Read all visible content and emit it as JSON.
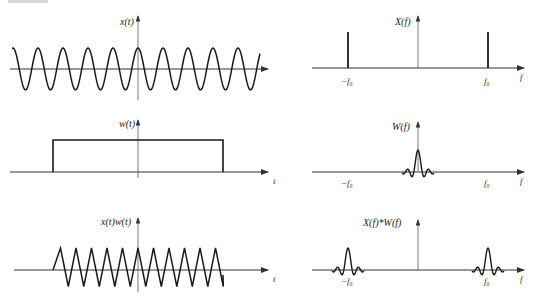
{
  "header_fragment": "",
  "panels": {
    "time": [
      {
        "id": "x",
        "ylabel": "x(t)",
        "xlabel": "",
        "signal": "cosine",
        "cycles": 10
      },
      {
        "id": "w",
        "ylabel": "w(t)",
        "xlabel": "t",
        "signal": "rectangular-window"
      },
      {
        "id": "xw",
        "ylabel": "x(t)w(t)",
        "xlabel": "t",
        "signal": "truncated-cosine",
        "cycles": 11
      }
    ],
    "freq": [
      {
        "id": "X",
        "ylabel": "X(f)",
        "xlabel": "f",
        "ticks": [
          "−f₀",
          "f₀"
        ],
        "signal": "impulses at ±f0"
      },
      {
        "id": "W",
        "ylabel": "W(f)",
        "xlabel": "f",
        "ticks": [
          "−f₀",
          "f₀"
        ],
        "signal": "sinc at 0"
      },
      {
        "id": "XW",
        "ylabel": "X(f)*W(f)",
        "xlabel": "f",
        "ticks": [
          "−f₀",
          "f₀"
        ],
        "signal": "sinc at ±f0"
      }
    ]
  },
  "colors": {
    "line": "#1a1a1a",
    "axis": "#333333",
    "background": "#ffffff"
  }
}
